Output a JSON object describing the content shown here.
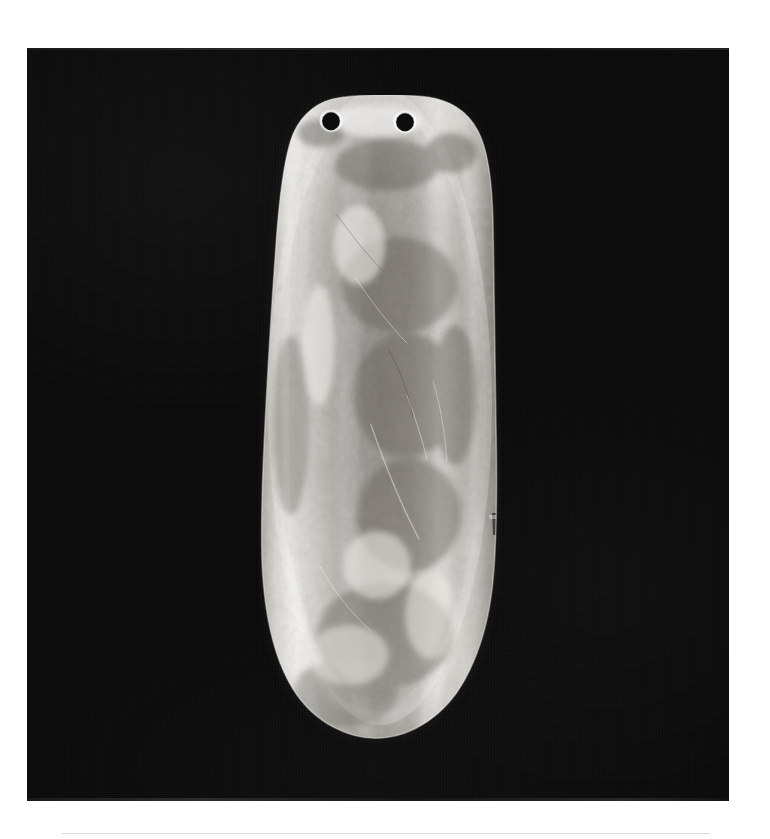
{
  "page": {
    "background_color": "#ffffff",
    "width": 770,
    "height": 839,
    "caption": "",
    "footer_rule_color": "#d9d9d9"
  },
  "photo": {
    "kind": "photograph",
    "medium": "black-and-white halftone print",
    "background_color": "#090909",
    "frame": {
      "x": 27,
      "y": 48,
      "width": 702,
      "height": 753
    }
  },
  "artifact": {
    "name": "pendant-gorget",
    "description": "Elongated flat pendant with rounded top and bottom, two drilled suspension perforations near the upper edge",
    "surface": "mottled, lightly corroded, with vertical burnished highlights",
    "highlight_color": "#f2f0ec",
    "midtone_color": "#b9b5ae",
    "shadow_color": "#6e6a64",
    "bounds": {
      "x": 259,
      "y": 95,
      "width": 242,
      "height": 648
    },
    "holes": [
      {
        "name": "suspension-hole-left",
        "cx": 331,
        "cy": 121,
        "r": 9.5
      },
      {
        "name": "suspension-hole-right",
        "cx": 405,
        "cy": 122,
        "r": 9.5
      }
    ],
    "edge_notch": {
      "name": "right-edge-step",
      "x": 494,
      "y": 524
    }
  }
}
